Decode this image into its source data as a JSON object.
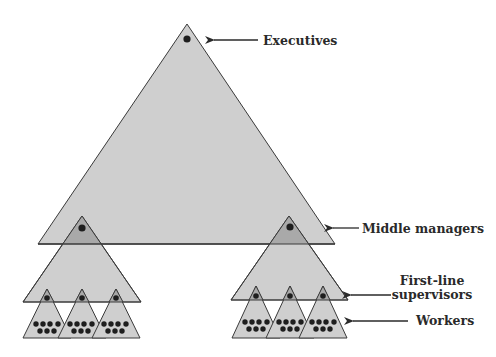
{
  "colors": {
    "fill": "#cfcfcf",
    "overlap": "#a9a9a9",
    "stroke": "#3a3a3a",
    "dot": "#1e1e1e",
    "text": "#2a2a2a"
  },
  "labels": {
    "executives": "Executives",
    "middle_managers": "Middle managers",
    "first_line_1": "First-line",
    "first_line_2": "supervisors",
    "workers": "Workers"
  },
  "levels": [
    {
      "name": "Executives",
      "count_shown": 1
    },
    {
      "name": "Middle managers",
      "count_shown": 2
    },
    {
      "name": "First-line supervisors",
      "count_shown": 6
    },
    {
      "name": "Workers",
      "dots_per_group": 7,
      "groups": 6
    }
  ]
}
